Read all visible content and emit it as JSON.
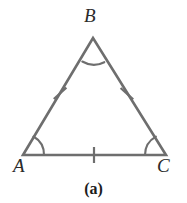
{
  "figure": {
    "kind": "geometry-diagram",
    "shape": "equilateral-triangle",
    "caption": "(a)",
    "background_color": "#ffffff",
    "stroke_color": "#6e6e6e",
    "label_color": "#2b2b2b",
    "caption_color": "#1c1c1c",
    "stroke_width": 2.6,
    "mark_stroke_width": 2.2
  },
  "vertices": {
    "A": {
      "label": "A",
      "x": 23,
      "y": 155,
      "label_x": 13,
      "label_y": 156
    },
    "B": {
      "label": "B",
      "x": 93,
      "y": 38,
      "label_x": 84,
      "label_y": 6
    },
    "C": {
      "label": "C",
      "x": 166,
      "y": 155,
      "label_x": 157,
      "label_y": 156
    }
  },
  "sides": [
    {
      "name": "AB",
      "from": "A",
      "to": "B",
      "tick_count": 1,
      "tick_x": 60,
      "tick_y": 93
    },
    {
      "name": "BC",
      "from": "B",
      "to": "C",
      "tick_count": 1,
      "tick_x": 127,
      "tick_y": 94
    },
    {
      "name": "AC",
      "from": "A",
      "to": "C",
      "tick_count": 1,
      "tick_x": 94,
      "tick_y": 155
    }
  ],
  "angle_marks": [
    {
      "at": "A",
      "arc_count": 1
    },
    {
      "at": "B",
      "arc_count": 1
    },
    {
      "at": "C",
      "arc_count": 1
    }
  ],
  "geometry_paths": {
    "triangle": "M 23 155 L 93 38 L 166 155 Z",
    "arc_at_A": "M 44.0 155 A 21 21 0 0 0 33.5 136.5",
    "arc_at_B": "M 82.3 61.5 A 23 23 0 0 0 104.3 62.2",
    "arc_at_C": "M 145.0 155 A 21 21 0 0 1 155.9 136.7",
    "tick_AB": "M 53.8 99.0 L 66.4 87.6",
    "tick_BC": "M 120.6 88.0 L 133.2 99.4",
    "tick_AC": "M 94 147 L 94 163"
  }
}
